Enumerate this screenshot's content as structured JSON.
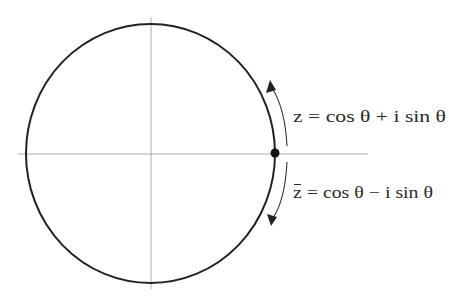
{
  "diagram": {
    "type": "unit-circle-complex-conjugate",
    "colors": {
      "background": "#ffffff",
      "circle": "#222222",
      "axes": "#9a9a9a",
      "text": "#2a2a2a",
      "point": "#111111"
    },
    "labels": {
      "upper": "z = cos θ + i sin θ",
      "lower_z": "z",
      "lower_rest": " = cos θ − i sin θ"
    },
    "arrows": [
      {
        "name": "counterclockwise-arrow",
        "direction": "up"
      },
      {
        "name": "clockwise-arrow",
        "direction": "down"
      }
    ],
    "point": {
      "name": "point-on-circle",
      "position": "rightmost intersection with real axis"
    }
  }
}
